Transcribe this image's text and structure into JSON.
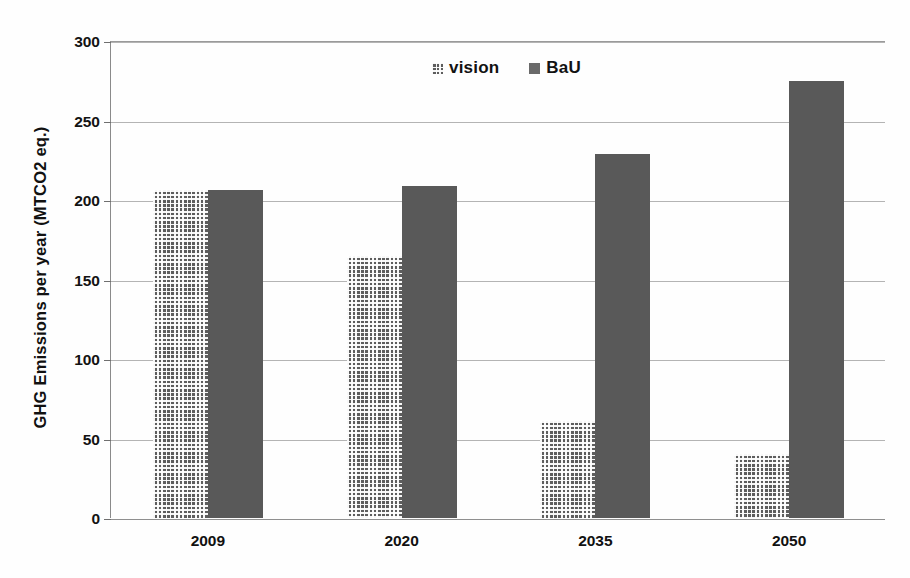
{
  "chart_data": {
    "type": "bar",
    "title": "",
    "subtitle": "",
    "xlabel": "",
    "ylabel": "GHG  Emissions per  year (MTCO2 eq.)",
    "categories": [
      "2009",
      "2020",
      "2035",
      "2050"
    ],
    "series": [
      {
        "name": "vision",
        "values": [
          206,
          165,
          61,
          40
        ],
        "color": "#5d5d5d",
        "fill": "checkered-pattern"
      },
      {
        "name": "BaU",
        "values": [
          206,
          209,
          229,
          275
        ],
        "color": "#595959",
        "fill": "solid"
      }
    ],
    "ylim": [
      0,
      300
    ],
    "ytick_step": 50,
    "ytick_labels": [
      "0",
      "50",
      "100",
      "150",
      "200",
      "250",
      "300"
    ],
    "grid": "horizontal",
    "legend_position": "top-center",
    "legend_entries": [
      "vision",
      "BaU"
    ],
    "annotations": []
  }
}
